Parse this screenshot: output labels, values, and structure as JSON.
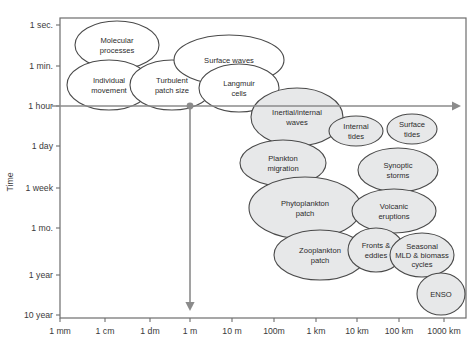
{
  "figure": {
    "axis_titles": {
      "y": "Time",
      "x": ""
    },
    "plot_frame": {
      "left": 60,
      "top": 18,
      "right": 466,
      "bottom": 318
    }
  },
  "chart_data": {
    "type": "scatter",
    "title": "",
    "xlabel": "",
    "ylabel": "Time",
    "grid": false,
    "legend": null,
    "x_tick_labels": [
      "1 mm",
      "1 cm",
      "1 dm",
      "1 m",
      "10 m",
      "100m",
      "1 km",
      "10 km",
      "100 km",
      "1000 km"
    ],
    "y_tick_labels": [
      "1 sec.",
      "1 min.",
      "1 hour",
      "1 day",
      "1 week",
      "1 mo.",
      "1 year",
      "10 year"
    ],
    "x_tick_positions": [
      60,
      105,
      150,
      190,
      232,
      274,
      316,
      357,
      399,
      444
    ],
    "y_tick_positions": [
      25,
      66,
      106,
      146,
      188,
      228,
      275,
      315
    ],
    "annotations": [
      {
        "name": "horizontal-scale-arrow",
        "from_label": "1 hour",
        "direction": "right"
      },
      {
        "name": "vertical-scale-arrow",
        "from_label": "1 m",
        "direction": "down"
      }
    ],
    "colors": {
      "bubble_fill_white": "#ffffff",
      "bubble_fill_grey": "#e7e8e9",
      "bubble_stroke": "#4a4a4a",
      "frame_stroke": "#6d6d6d",
      "arrow": "#8b8b8b",
      "text": "#2b2b2b"
    },
    "points": [
      {
        "label": "Molecular processes",
        "lines": [
          "Molecular",
          "processes"
        ],
        "cx": 117,
        "cy": 45,
        "rx": 42,
        "ry": 24,
        "fill": "white"
      },
      {
        "label": "Individual movement",
        "lines": [
          "Individual",
          "movement"
        ],
        "cx": 109,
        "cy": 85,
        "rx": 42,
        "ry": 25,
        "fill": "white"
      },
      {
        "label": "Turbulent patch size",
        "lines": [
          "Turbulent",
          "patch size"
        ],
        "cx": 172,
        "cy": 85,
        "rx": 42,
        "ry": 25,
        "fill": "white"
      },
      {
        "label": "Surface waves",
        "lines": [
          "Surface waves"
        ],
        "cx": 229,
        "cy": 60,
        "rx": 55,
        "ry": 25,
        "fill": "white"
      },
      {
        "label": "Langmuir cells",
        "lines": [
          "Langmuir",
          "cells"
        ],
        "cx": 239,
        "cy": 88,
        "rx": 40,
        "ry": 24,
        "fill": "white"
      },
      {
        "label": "Inertial/internal waves",
        "lines": [
          "Inertial/internal",
          "waves"
        ],
        "cx": 297,
        "cy": 117,
        "rx": 46,
        "ry": 29,
        "fill": "grey"
      },
      {
        "label": "Internal tides",
        "lines": [
          "Internal",
          "tides"
        ],
        "cx": 356,
        "cy": 131,
        "rx": 27,
        "ry": 15,
        "fill": "grey"
      },
      {
        "label": "Surface tides",
        "lines": [
          "Surface",
          "tides"
        ],
        "cx": 412,
        "cy": 129,
        "rx": 25,
        "ry": 15,
        "fill": "grey"
      },
      {
        "label": "Plankton migration",
        "lines": [
          "Plankton",
          "migration"
        ],
        "cx": 283,
        "cy": 163,
        "rx": 43,
        "ry": 23,
        "fill": "grey"
      },
      {
        "label": "Synoptic storms",
        "lines": [
          "Synoptic",
          "storms"
        ],
        "cx": 398,
        "cy": 170,
        "rx": 40,
        "ry": 22,
        "fill": "grey"
      },
      {
        "label": "Phytoplankton patch",
        "lines": [
          "Phytoplankton",
          "patch"
        ],
        "cx": 305,
        "cy": 208,
        "rx": 56,
        "ry": 31,
        "fill": "grey"
      },
      {
        "label": "Volcanic eruptions",
        "lines": [
          "Volcanic",
          "eruptions"
        ],
        "cx": 394,
        "cy": 211,
        "rx": 42,
        "ry": 22,
        "fill": "grey"
      },
      {
        "label": "Zooplankton patch",
        "lines": [
          "Zooplankton",
          "patch"
        ],
        "cx": 320,
        "cy": 255,
        "rx": 46,
        "ry": 25,
        "fill": "grey"
      },
      {
        "label": "Fronts & eddies",
        "lines": [
          "Fronts &",
          "eddies"
        ],
        "cx": 376,
        "cy": 250,
        "rx": 28,
        "ry": 22,
        "fill": "grey"
      },
      {
        "label": "Seasonal MLD & biomass cycles",
        "lines": [
          "Seasonal",
          "MLD & biomass",
          "cycles"
        ],
        "cx": 422,
        "cy": 255,
        "rx": 32,
        "ry": 22,
        "fill": "grey"
      },
      {
        "label": "ENSO",
        "lines": [
          "ENSO"
        ],
        "cx": 441,
        "cy": 294,
        "rx": 24,
        "ry": 21,
        "fill": "grey"
      }
    ]
  }
}
